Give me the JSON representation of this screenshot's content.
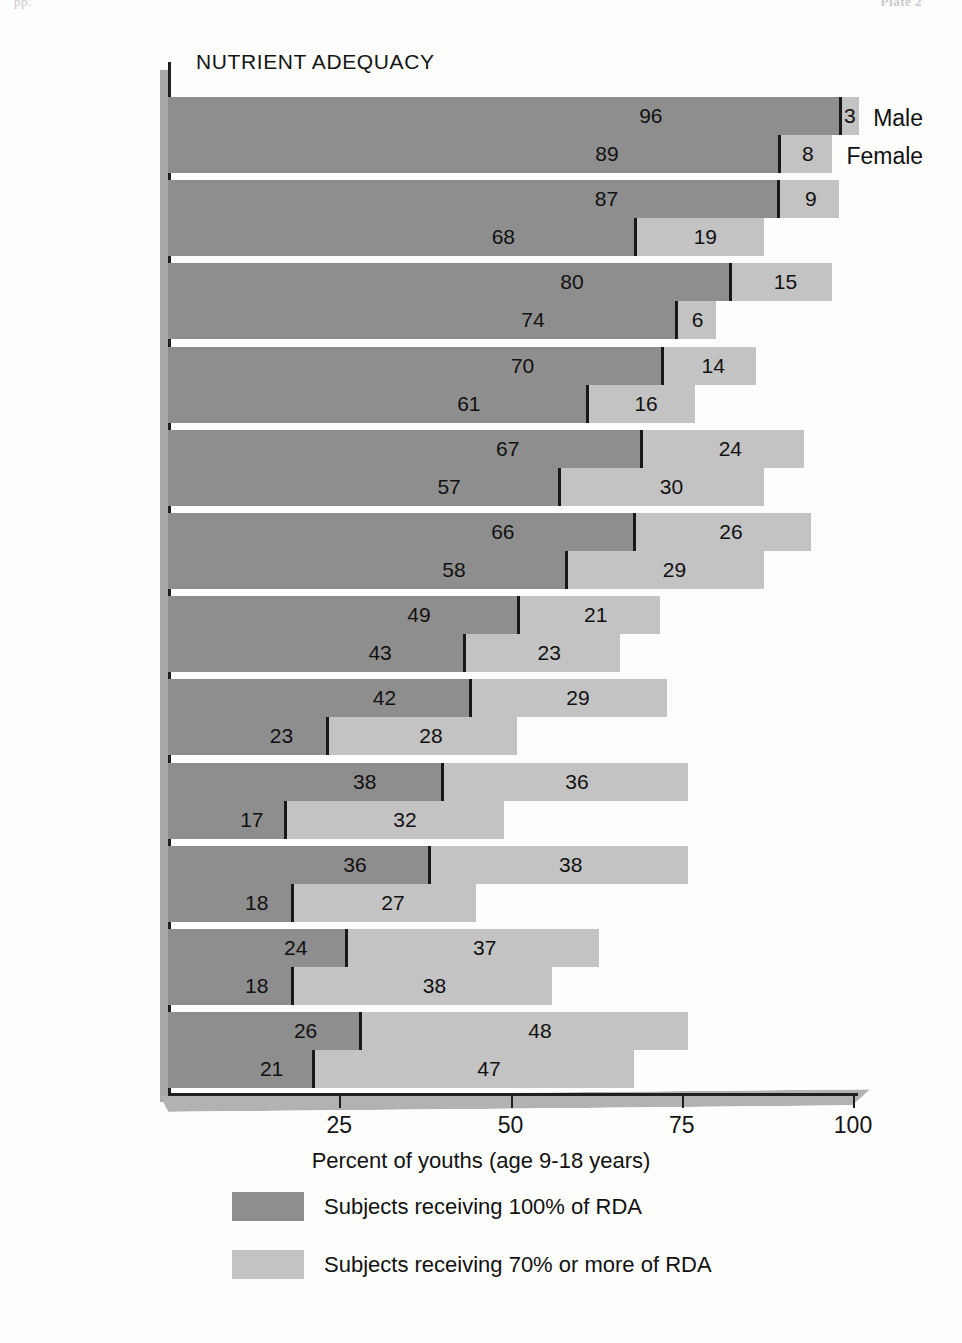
{
  "page": {
    "header_left": "pp.",
    "header_right": "Plate 2"
  },
  "chart_data": {
    "type": "bar",
    "subtype": "grouped-stacked-horizontal",
    "title": "NUTRIENT ADEQUACY",
    "xlabel": "Percent of youths (age 9-18 years)",
    "ylabel": "",
    "xlim": [
      0,
      100
    ],
    "xticks": [
      25,
      50,
      75,
      100
    ],
    "xtick_labels": [
      "25",
      "50",
      "75",
      "100"
    ],
    "grid": false,
    "legend_position": "bottom-left",
    "series_names": [
      "Male",
      "Female"
    ],
    "stack_names": [
      "Subjects receiving 100% of RDA",
      "Subjects receiving 70% or more of RDA"
    ],
    "categories": [
      "Protein",
      "Vitamin B12",
      "Riboflavin",
      "Vitamin C",
      "Thiamin",
      "Niacin",
      "Vitamin A",
      "Calcium",
      "Vitamin B6",
      "Iron",
      "Magnesium",
      "Energy"
    ],
    "rows": [
      {
        "category": "Protein",
        "label_html": "Protein",
        "muted": true,
        "male": {
          "rda100": 96,
          "extra70": 3
        },
        "female": {
          "rda100": 89,
          "extra70": 8
        }
      },
      {
        "category": "Vitamin B12",
        "label_html": "Vitamin B<sub>12</sub>",
        "muted": false,
        "male": {
          "rda100": 87,
          "extra70": 9
        },
        "female": {
          "rda100": 68,
          "extra70": 19
        }
      },
      {
        "category": "Riboflavin",
        "label_html": "Riboflavin",
        "muted": false,
        "male": {
          "rda100": 80,
          "extra70": 15
        },
        "female": {
          "rda100": 74,
          "extra70": 6
        }
      },
      {
        "category": "Vitamin C",
        "label_html": "Vitamin C",
        "muted": false,
        "male": {
          "rda100": 70,
          "extra70": 14
        },
        "female": {
          "rda100": 61,
          "extra70": 16
        }
      },
      {
        "category": "Thiamin",
        "label_html": "Thiamin",
        "muted": false,
        "male": {
          "rda100": 67,
          "extra70": 24
        },
        "female": {
          "rda100": 57,
          "extra70": 30
        }
      },
      {
        "category": "Niacin",
        "label_html": "Niacin",
        "muted": false,
        "male": {
          "rda100": 66,
          "extra70": 26
        },
        "female": {
          "rda100": 58,
          "extra70": 29
        }
      },
      {
        "category": "Vitamin A",
        "label_html": "Vitamin A",
        "muted": false,
        "male": {
          "rda100": 49,
          "extra70": 21
        },
        "female": {
          "rda100": 43,
          "extra70": 23
        }
      },
      {
        "category": "Calcium",
        "label_html": "Calcium",
        "muted": false,
        "male": {
          "rda100": 42,
          "extra70": 29
        },
        "female": {
          "rda100": 23,
          "extra70": 28
        }
      },
      {
        "category": "Vitamin B6",
        "label_html": "Vitamin B<sub>6</sub>",
        "muted": false,
        "male": {
          "rda100": 38,
          "extra70": 36
        },
        "female": {
          "rda100": 17,
          "extra70": 32
        }
      },
      {
        "category": "Iron",
        "label_html": "Iron",
        "muted": false,
        "male": {
          "rda100": 36,
          "extra70": 38
        },
        "female": {
          "rda100": 18,
          "extra70": 27
        }
      },
      {
        "category": "Magnesium",
        "label_html": "Magnesium",
        "muted": false,
        "male": {
          "rda100": 24,
          "extra70": 37
        },
        "female": {
          "rda100": 18,
          "extra70": 38
        }
      },
      {
        "category": "Energy",
        "label_html": "Energy",
        "muted": true,
        "male": {
          "rda100": 26,
          "extra70": 48
        },
        "female": {
          "rda100": 21,
          "extra70": 47
        }
      }
    ]
  },
  "series_labels": {
    "male": "Male",
    "female": "Female"
  },
  "legend": {
    "items": [
      {
        "swatch_color": "#8e8e8e",
        "text": "Subjects receiving 100% of RDA"
      },
      {
        "swatch_color": "#c3c3c3",
        "text": "Subjects receiving 70% or more of RDA"
      }
    ]
  },
  "colors": {
    "dark_gray": "#8e8e8e",
    "light_gray": "#c3c3c3",
    "axis": "#1f1f1f",
    "shadow": "#b2b2b2",
    "muted_label": "#9d9d9d"
  }
}
